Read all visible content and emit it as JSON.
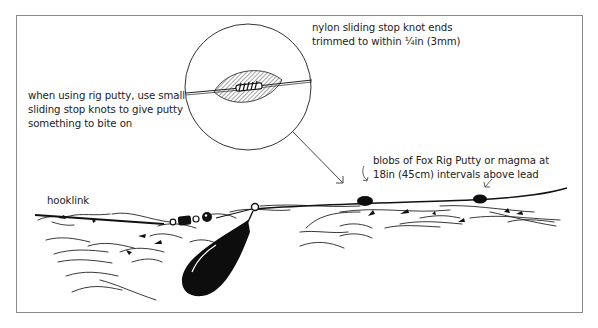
{
  "diagram": {
    "type": "fishing-rig-illustration",
    "labels": {
      "knot_note": [
        "nylon sliding stop knot ends",
        "trimmed to within ¼in (3mm)"
      ],
      "putty_note": [
        "when using rig putty, use small",
        "sliding stop knots to give putty",
        "something to bite on"
      ],
      "blobs_note": [
        "blobs of Fox Rig Putty or magma at",
        "18in (45cm) intervals above lead"
      ],
      "hooklink": "hooklink"
    },
    "components": [
      {
        "id": "hooklink-line",
        "label": "hooklink"
      },
      {
        "id": "swivel-and-beads"
      },
      {
        "id": "lead-weight"
      },
      {
        "id": "putty-blob-1"
      },
      {
        "id": "putty-blob-2"
      },
      {
        "id": "magnified-knot-inset"
      },
      {
        "id": "lakebed"
      }
    ],
    "colors": {
      "ink": "#111111",
      "frame": "#8a8a8a",
      "background": "#ffffff"
    }
  }
}
